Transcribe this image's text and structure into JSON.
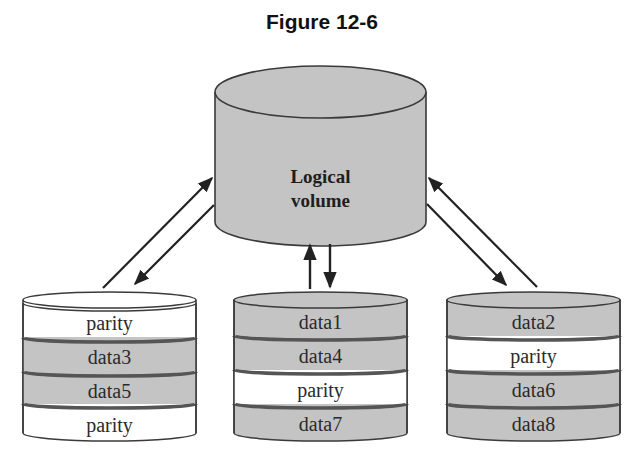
{
  "figure": {
    "title": "Figure 12-6"
  },
  "logical_volume": {
    "label_line1": "Logical",
    "label_line2": "volume",
    "fill": "#c4c4c4"
  },
  "colors": {
    "data_fill": "#c4c4c4",
    "parity_fill": "#ffffff",
    "stroke": "#3a3a3a",
    "arrow": "#222222"
  },
  "disks": [
    {
      "name": "disk-1",
      "blocks": [
        {
          "label": "parity",
          "type": "parity"
        },
        {
          "label": "data3",
          "type": "data"
        },
        {
          "label": "data5",
          "type": "data"
        },
        {
          "label": "parity",
          "type": "parity"
        }
      ]
    },
    {
      "name": "disk-2",
      "blocks": [
        {
          "label": "data1",
          "type": "data"
        },
        {
          "label": "data4",
          "type": "data"
        },
        {
          "label": "parity",
          "type": "parity"
        },
        {
          "label": "data7",
          "type": "data"
        }
      ]
    },
    {
      "name": "disk-3",
      "blocks": [
        {
          "label": "data2",
          "type": "data"
        },
        {
          "label": "parity",
          "type": "parity"
        },
        {
          "label": "data6",
          "type": "data"
        },
        {
          "label": "data8",
          "type": "data"
        }
      ]
    }
  ]
}
